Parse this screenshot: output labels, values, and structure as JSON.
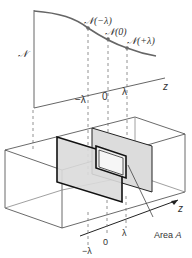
{
  "graph": {
    "y_axis_label": "𝒩",
    "x_axis_label": "z",
    "points": [
      {
        "label": "𝒩(−λ)",
        "position": "−λ"
      },
      {
        "label": "𝒩(0)",
        "position": "0"
      },
      {
        "label": "𝒩(+λ)",
        "position": "λ"
      }
    ],
    "ticks": [
      "−λ",
      "0",
      "λ"
    ]
  },
  "box": {
    "axis_label": "z",
    "ticks": [
      "−λ",
      "0",
      "λ"
    ],
    "area_label": "Area ",
    "area_symbol": "A"
  },
  "colors": {
    "line": "#555555",
    "plane_fill": "#dcdcdc",
    "text": "#333333"
  }
}
